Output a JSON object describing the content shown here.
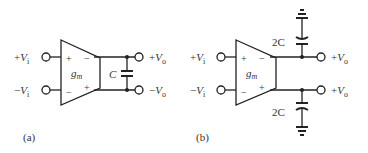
{
  "figure": {
    "panel_a": {
      "caption": "(a)",
      "inputs": [
        {
          "sign": "+",
          "symbol": "V",
          "subscript": "i"
        },
        {
          "sign": "−",
          "symbol": "V",
          "subscript": "i"
        }
      ],
      "outputs": [
        {
          "sign": "+",
          "symbol": "V",
          "subscript": "o"
        },
        {
          "sign": "−",
          "symbol": "V",
          "subscript": "o"
        }
      ],
      "amplifier": {
        "label_main": "g",
        "label_sub": "m",
        "in_top_sign": "+",
        "in_bottom_sign": "−",
        "out_top_sign": "−",
        "out_bottom_sign": "+"
      },
      "capacitor_label": "C"
    },
    "panel_b": {
      "caption": "(b)",
      "inputs": [
        {
          "sign": "+",
          "symbol": "V",
          "subscript": "i"
        },
        {
          "sign": "−",
          "symbol": "V",
          "subscript": "i"
        }
      ],
      "outputs": [
        {
          "sign": "+",
          "symbol": "V",
          "subscript": "o"
        },
        {
          "sign": "+",
          "symbol": "V",
          "subscript": "o"
        }
      ],
      "amplifier": {
        "label_main": "g",
        "label_sub": "m",
        "in_top_sign": "+",
        "in_bottom_sign": "−",
        "out_top_sign": "−",
        "out_bottom_sign": "+"
      },
      "capacitor_top_label": "2C",
      "capacitor_bottom_label": "2C"
    }
  }
}
